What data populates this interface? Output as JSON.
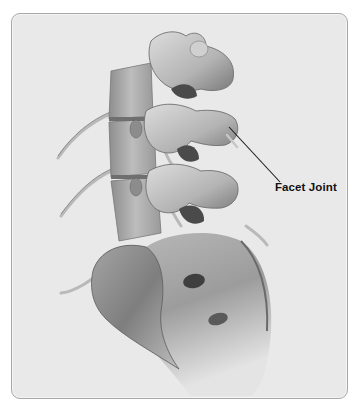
{
  "figure": {
    "annotations": [
      {
        "label": "Facet Joint",
        "pointer_from": [
          279,
          181
        ],
        "pointer_to": [
          228,
          126
        ]
      }
    ]
  },
  "colors": {
    "frame_background": "#e9e9e9",
    "frame_border": "#a8a8a8",
    "bone_light": "#d6d6d6",
    "bone_mid": "#a9a9a9",
    "bone_dark": "#6b6b6b",
    "label_text": "#111111"
  }
}
